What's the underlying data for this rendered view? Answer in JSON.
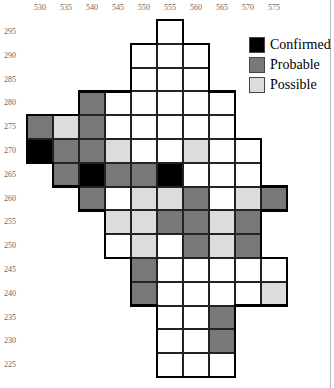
{
  "colors": {
    "confirmed": "#000000",
    "probable": "#787878",
    "possible": "#dcdcdc",
    "none": "#ffffff"
  },
  "columns": [
    "530",
    "535",
    "540",
    "545",
    "550",
    "555",
    "560",
    "565",
    "570",
    "575"
  ],
  "rows": [
    "295",
    "290",
    "285",
    "280",
    "275",
    "270",
    "265",
    "260",
    "255",
    "250",
    "245",
    "240",
    "235",
    "230",
    "225"
  ],
  "legend": [
    {
      "key": "confirmed",
      "label": "Confirmed"
    },
    {
      "key": "probable",
      "label": "Probable"
    },
    {
      "key": "possible",
      "label": "Possible"
    }
  ],
  "cells": [
    [
      "555",
      "295",
      "none"
    ],
    [
      "550",
      "290",
      "none"
    ],
    [
      "555",
      "290",
      "none"
    ],
    [
      "560",
      "290",
      "none"
    ],
    [
      "550",
      "285",
      "none"
    ],
    [
      "555",
      "285",
      "none"
    ],
    [
      "560",
      "285",
      "none"
    ],
    [
      "540",
      "280",
      "probable"
    ],
    [
      "545",
      "280",
      "none"
    ],
    [
      "550",
      "280",
      "none"
    ],
    [
      "555",
      "280",
      "none"
    ],
    [
      "560",
      "280",
      "none"
    ],
    [
      "565",
      "280",
      "none"
    ],
    [
      "530",
      "275",
      "probable"
    ],
    [
      "535",
      "275",
      "possible"
    ],
    [
      "540",
      "275",
      "probable"
    ],
    [
      "545",
      "275",
      "none"
    ],
    [
      "550",
      "275",
      "none"
    ],
    [
      "555",
      "275",
      "none"
    ],
    [
      "560",
      "275",
      "none"
    ],
    [
      "565",
      "275",
      "none"
    ],
    [
      "530",
      "270",
      "confirmed"
    ],
    [
      "535",
      "270",
      "probable"
    ],
    [
      "540",
      "270",
      "probable"
    ],
    [
      "545",
      "270",
      "possible"
    ],
    [
      "550",
      "270",
      "none"
    ],
    [
      "555",
      "270",
      "none"
    ],
    [
      "560",
      "270",
      "possible"
    ],
    [
      "565",
      "270",
      "none"
    ],
    [
      "570",
      "270",
      "none"
    ],
    [
      "535",
      "265",
      "probable"
    ],
    [
      "540",
      "265",
      "confirmed"
    ],
    [
      "545",
      "265",
      "probable"
    ],
    [
      "550",
      "265",
      "probable"
    ],
    [
      "555",
      "265",
      "confirmed"
    ],
    [
      "560",
      "265",
      "none"
    ],
    [
      "565",
      "265",
      "none"
    ],
    [
      "570",
      "265",
      "none"
    ],
    [
      "540",
      "260",
      "probable"
    ],
    [
      "545",
      "260",
      "none"
    ],
    [
      "550",
      "260",
      "possible"
    ],
    [
      "555",
      "260",
      "possible"
    ],
    [
      "560",
      "260",
      "probable"
    ],
    [
      "565",
      "260",
      "none"
    ],
    [
      "570",
      "260",
      "possible"
    ],
    [
      "575",
      "260",
      "probable"
    ],
    [
      "545",
      "255",
      "possible"
    ],
    [
      "550",
      "255",
      "possible"
    ],
    [
      "555",
      "255",
      "probable"
    ],
    [
      "560",
      "255",
      "probable"
    ],
    [
      "565",
      "255",
      "possible"
    ],
    [
      "570",
      "255",
      "probable"
    ],
    [
      "545",
      "250",
      "none"
    ],
    [
      "550",
      "250",
      "possible"
    ],
    [
      "555",
      "250",
      "none"
    ],
    [
      "560",
      "250",
      "probable"
    ],
    [
      "565",
      "250",
      "possible"
    ],
    [
      "570",
      "250",
      "probable"
    ],
    [
      "550",
      "245",
      "probable"
    ],
    [
      "555",
      "245",
      "none"
    ],
    [
      "560",
      "245",
      "none"
    ],
    [
      "565",
      "245",
      "none"
    ],
    [
      "570",
      "245",
      "none"
    ],
    [
      "575",
      "245",
      "none"
    ],
    [
      "550",
      "240",
      "probable"
    ],
    [
      "555",
      "240",
      "none"
    ],
    [
      "560",
      "240",
      "none"
    ],
    [
      "565",
      "240",
      "none"
    ],
    [
      "570",
      "240",
      "none"
    ],
    [
      "575",
      "240",
      "possible"
    ],
    [
      "555",
      "235",
      "none"
    ],
    [
      "560",
      "235",
      "none"
    ],
    [
      "565",
      "235",
      "probable"
    ],
    [
      "555",
      "230",
      "none"
    ],
    [
      "560",
      "230",
      "none"
    ],
    [
      "565",
      "230",
      "probable"
    ],
    [
      "555",
      "225",
      "none"
    ],
    [
      "560",
      "225",
      "none"
    ],
    [
      "565",
      "225",
      "none"
    ]
  ]
}
